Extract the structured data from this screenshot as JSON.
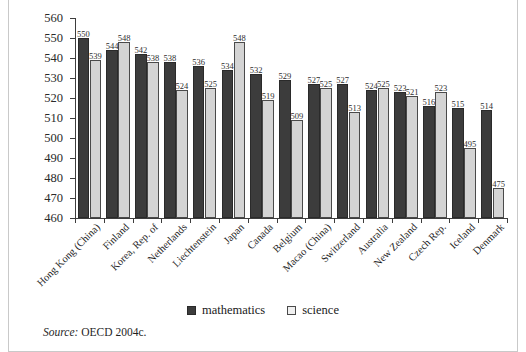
{
  "chart_data": {
    "type": "bar",
    "title": "",
    "subtitle": "",
    "xlabel": "",
    "ylabel": "",
    "ylim": [
      460,
      560
    ],
    "ytick_step": 10,
    "yticks": [
      560,
      550,
      540,
      530,
      520,
      510,
      500,
      490,
      480,
      470,
      460
    ],
    "grid": false,
    "legend_position": "bottom-center",
    "categories": [
      "Hong Kong (China)",
      "Finland",
      "Korea, Rep. of",
      "Netherlands",
      "Liechtenstein",
      "Japan",
      "Canada",
      "Belgium",
      "Macao (China)",
      "Switzerland",
      "Australia",
      "New Zealand",
      "Czech Rep.",
      "Iceland",
      "Denmark"
    ],
    "series": [
      {
        "name": "mathematics",
        "color": "#3c3c3c",
        "values": [
          550,
          544,
          542,
          538,
          536,
          534,
          532,
          529,
          527,
          527,
          524,
          523,
          516,
          515,
          514
        ]
      },
      {
        "name": "science",
        "color": "#d4d4d4",
        "values": [
          539,
          548,
          538,
          524,
          525,
          548,
          519,
          509,
          525,
          513,
          525,
          521,
          523,
          495,
          475
        ]
      }
    ],
    "annotations": []
  },
  "legend": {
    "items": [
      {
        "label": "mathematics",
        "swatch": "dark-filled-square"
      },
      {
        "label": "science",
        "swatch": "light-outlined-square"
      }
    ]
  },
  "source": {
    "label": "Source:",
    "text": "OECD 2004c."
  }
}
